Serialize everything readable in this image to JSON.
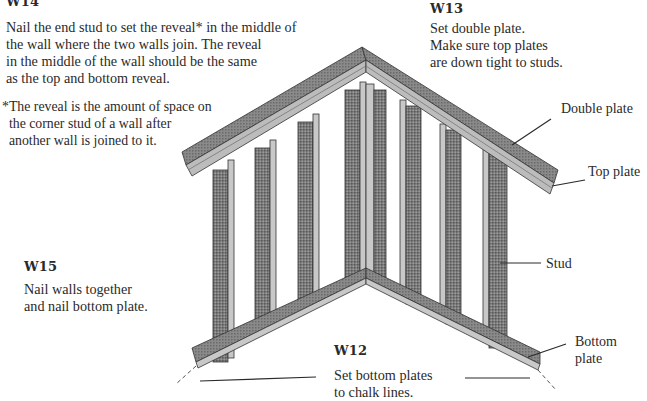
{
  "steps": {
    "w14": {
      "label": "W14",
      "text": "Nail the end stud to set the reveal* in the middle of\nthe wall where the two walls join. The reveal\nin the middle of the wall should be the same\nas the top and bottom reveal.",
      "footnote": "*The reveal is the amount of space on\n  the corner stud of a wall after\n  another wall is joined to it."
    },
    "w13": {
      "label": "W13",
      "text": "Set double plate.\nMake sure top plates\nare down tight to studs."
    },
    "w15": {
      "label": "W15",
      "text": "Nail walls together\nand nail bottom plate."
    },
    "w12": {
      "label": "W12",
      "text": "Set bottom plates\nto chalk lines."
    }
  },
  "callouts": {
    "double_plate": "Double plate",
    "top_plate": "Top plate",
    "stud": "Stud",
    "bottom_plate": "Bottom\nplate"
  },
  "colors": {
    "wood_dark": "#6e6e6e",
    "wood_mid": "#8c8c8c",
    "wood_light": "#c8c8c8",
    "line": "#2a2a2a"
  }
}
